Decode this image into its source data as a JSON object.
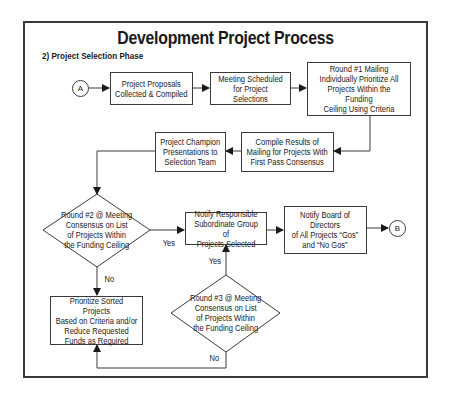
{
  "diagram": {
    "title": "Development Project Process",
    "subtitle": "2) Project Selection Phase",
    "connectors": {
      "start": "A",
      "end": "B"
    },
    "nodes": {
      "proposals": "Project Proposals\nCollected & Compiled",
      "meeting": "Meeting Scheduled\nfor Project Selections",
      "round1": "Round #1 Mailing\nIndividually Prioritize All\nProjects Within the Funding\nCeiling Using Criteria",
      "compile": "Compile Results of\nMailing for Projects With\nFirst Pass Consensus",
      "champion": "Project Champion\nPresentations to\nSelection Team",
      "round2": "Round #2 @ Meeting\nConsensus on List\nof Projects Within\nthe Funding Ceiling",
      "notify_subordinate": "Notify Responsible\nSubordinate Group of\nProjects Selected",
      "notify_board": "Notify Board of\nDirectors\nof All Projects “Gos”\nand “No Gos”",
      "prioritize": "Prioritize Sorted Projects\nBased on Criteria and/or\nReduce Requested\nFunds as Required",
      "round3": "Round #3 @ Meeting\nConsensus on List\nof Projects Within\nthe Funding Ceiling"
    },
    "edge_labels": {
      "round2_yes": "Yes",
      "round2_no": "No",
      "round3_yes": "Yes",
      "round3_no": "No"
    },
    "edges": [
      {
        "from": "A",
        "to": "proposals"
      },
      {
        "from": "proposals",
        "to": "meeting"
      },
      {
        "from": "meeting",
        "to": "round1"
      },
      {
        "from": "round1",
        "to": "compile"
      },
      {
        "from": "compile",
        "to": "champion"
      },
      {
        "from": "champion",
        "to": "round2"
      },
      {
        "from": "round2",
        "to": "notify_subordinate",
        "label": "Yes"
      },
      {
        "from": "round2",
        "to": "prioritize",
        "label": "No"
      },
      {
        "from": "notify_subordinate",
        "to": "notify_board"
      },
      {
        "from": "notify_board",
        "to": "B"
      },
      {
        "from": "round3",
        "to": "notify_subordinate",
        "label": "Yes"
      },
      {
        "from": "round3",
        "to": "prioritize",
        "label": "No"
      }
    ],
    "colors": {
      "line": "#3a3a3a",
      "background": "#ffffff",
      "text": "#1a1a1a"
    }
  }
}
